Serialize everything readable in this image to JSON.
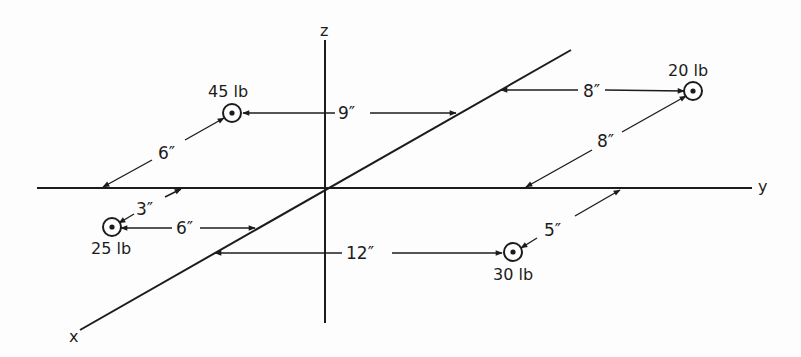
{
  "diagram": {
    "axes": {
      "x_label": "x",
      "y_label": "y",
      "z_label": "z"
    },
    "masses": [
      {
        "id": "m45",
        "label": "45 lb",
        "weight_lb": 45
      },
      {
        "id": "m20",
        "label": "20 lb",
        "weight_lb": 20
      },
      {
        "id": "m25",
        "label": "25 lb",
        "weight_lb": 25
      },
      {
        "id": "m30",
        "label": "30 lb",
        "weight_lb": 30
      }
    ],
    "dimensions": [
      {
        "id": "d45_z_to_x",
        "label": "9″",
        "inches": 9
      },
      {
        "id": "d45_to_y",
        "label": "6″",
        "inches": 6
      },
      {
        "id": "d20_to_x",
        "label": "8″",
        "inches": 8
      },
      {
        "id": "d20_to_y",
        "label": "8″",
        "inches": 8
      },
      {
        "id": "d25_to_y",
        "label": "3″",
        "inches": 3
      },
      {
        "id": "d25_to_x",
        "label": "6″",
        "inches": 6
      },
      {
        "id": "d30_to_x",
        "label": "12″",
        "inches": 12
      },
      {
        "id": "d30_to_y",
        "label": "5″",
        "inches": 5
      }
    ]
  }
}
